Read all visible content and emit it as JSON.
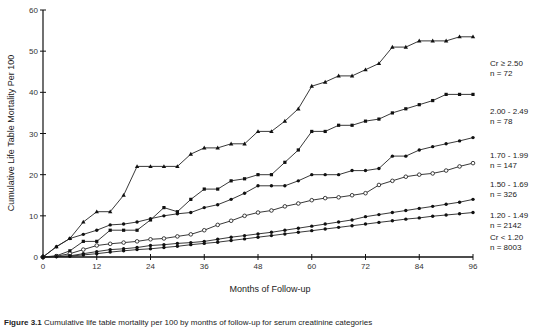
{
  "chart_data": {
    "type": "line",
    "title": "",
    "xlabel": "Months of Follow-up",
    "ylabel": "Cumulative Life Table Mortality Per 100",
    "xlim": [
      0,
      96
    ],
    "ylim": [
      0,
      60
    ],
    "xticks": [
      0,
      12,
      24,
      36,
      48,
      60,
      72,
      84,
      96
    ],
    "yticks": [
      0,
      10,
      20,
      30,
      40,
      50,
      60
    ],
    "grid": false,
    "legend_position": "right, inline labels at line ends",
    "series": [
      {
        "name": "Cr ≥ 2.50",
        "n": "n  =  72",
        "marker": "triangle",
        "x": [
          0,
          3,
          6,
          9,
          12,
          15,
          18,
          21,
          24,
          27,
          30,
          33,
          36,
          39,
          42,
          45,
          48,
          51,
          54,
          57,
          60,
          63,
          66,
          69,
          72,
          75,
          78,
          81,
          84,
          87,
          90,
          93,
          96
        ],
        "values": [
          0,
          2.5,
          4.5,
          8.5,
          11,
          11,
          15,
          22,
          22,
          22,
          22,
          25,
          26.5,
          26.5,
          27.5,
          27.5,
          30.5,
          30.5,
          33,
          36,
          41.5,
          42.5,
          44,
          44,
          45.5,
          47,
          51,
          51,
          52.5,
          52.5,
          52.5,
          53.5,
          53.5
        ]
      },
      {
        "name": "2.00 - 2.49",
        "n": "n  =  78",
        "marker": "x-square",
        "x": [
          0,
          3,
          6,
          9,
          12,
          15,
          18,
          21,
          24,
          27,
          30,
          33,
          36,
          39,
          42,
          45,
          48,
          51,
          54,
          57,
          60,
          63,
          66,
          69,
          72,
          75,
          78,
          81,
          84,
          87,
          90,
          93,
          96
        ],
        "values": [
          0,
          0.3,
          1.5,
          3.8,
          3.8,
          6.5,
          6.5,
          6.5,
          9,
          12,
          11,
          14,
          16.5,
          16.5,
          18.5,
          19,
          20,
          20,
          23,
          26,
          30.5,
          30.5,
          32,
          32,
          33,
          33.5,
          35,
          36,
          37,
          38,
          39.5,
          39.5,
          39.5
        ]
      },
      {
        "name": "1.70 - 1.99",
        "n": "n  =  147",
        "marker": "filled-circle",
        "x": [
          0,
          3,
          6,
          9,
          12,
          15,
          18,
          21,
          24,
          27,
          30,
          33,
          36,
          39,
          42,
          45,
          48,
          51,
          54,
          57,
          60,
          63,
          66,
          69,
          72,
          75,
          78,
          81,
          84,
          87,
          90,
          93,
          96
        ],
        "values": [
          0,
          2.5,
          4.5,
          5.5,
          6.5,
          7.8,
          8,
          8.5,
          9.3,
          10,
          10.5,
          10.8,
          12,
          12.7,
          14,
          15.5,
          17.3,
          17.3,
          17.3,
          18.5,
          20,
          20,
          20,
          21,
          21,
          21.5,
          24.5,
          24.5,
          26,
          26.8,
          27.5,
          28.2,
          29
        ]
      },
      {
        "name": "1.50 - 1.69",
        "n": "n  =  326",
        "marker": "open-circle",
        "x": [
          0,
          3,
          6,
          9,
          12,
          15,
          18,
          21,
          24,
          27,
          30,
          33,
          36,
          39,
          42,
          45,
          48,
          51,
          54,
          57,
          60,
          63,
          66,
          69,
          72,
          75,
          78,
          81,
          84,
          87,
          90,
          93,
          96
        ],
        "values": [
          0,
          0.2,
          0.8,
          1.8,
          2.8,
          3.2,
          3.5,
          3.8,
          4.3,
          4.5,
          5,
          5.5,
          6.5,
          7.8,
          8.8,
          10,
          10.8,
          11.3,
          12.3,
          13,
          13.8,
          14.3,
          14.5,
          15,
          15.5,
          17.5,
          18.5,
          19.5,
          20,
          20.3,
          21,
          22,
          22.8
        ]
      },
      {
        "name": "1.20 - 1.49",
        "n": "n  =  2142",
        "marker": "filled-circle",
        "x": [
          0,
          3,
          6,
          9,
          12,
          15,
          18,
          21,
          24,
          27,
          30,
          33,
          36,
          39,
          42,
          45,
          48,
          51,
          54,
          57,
          60,
          63,
          66,
          69,
          72,
          75,
          78,
          81,
          84,
          87,
          90,
          93,
          96
        ],
        "values": [
          0,
          0.1,
          0.3,
          0.8,
          1.3,
          1.8,
          2,
          2.3,
          2.8,
          3,
          3.3,
          3.5,
          3.8,
          4.3,
          4.8,
          5.2,
          5.6,
          6,
          6.5,
          7,
          7.5,
          8,
          8.5,
          9,
          9.8,
          10.3,
          10.8,
          11.3,
          11.8,
          12.3,
          12.8,
          13.3,
          14
        ]
      },
      {
        "name": "Cr < 1.20",
        "n": "n  =  8003",
        "marker": "filled-circle",
        "x": [
          0,
          3,
          6,
          9,
          12,
          15,
          18,
          21,
          24,
          27,
          30,
          33,
          36,
          39,
          42,
          45,
          48,
          51,
          54,
          57,
          60,
          63,
          66,
          69,
          72,
          75,
          78,
          81,
          84,
          87,
          90,
          93,
          96
        ],
        "values": [
          0,
          0.1,
          0.2,
          0.5,
          0.8,
          1.2,
          1.5,
          1.8,
          2,
          2.3,
          2.6,
          3,
          3.3,
          3.6,
          4,
          4.4,
          4.8,
          5.2,
          5.6,
          6,
          6.4,
          6.8,
          7.2,
          7.6,
          8,
          8.4,
          8.8,
          9.2,
          9.5,
          9.9,
          10.2,
          10.5,
          10.8
        ]
      }
    ]
  },
  "caption": {
    "label": "Figure 3.1",
    "text": "Cumulative life table mortality per 100 by months of follow-up for serum creatinine categories"
  }
}
